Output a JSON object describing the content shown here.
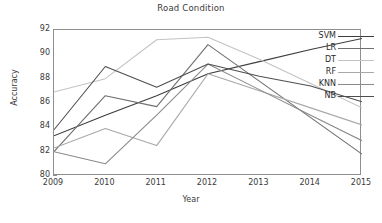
{
  "chart_data": {
    "type": "line",
    "title": "Road Condition",
    "xlabel": "Year",
    "ylabel": "Accuracy",
    "x": [
      2009,
      2010,
      2011,
      2012,
      2013,
      2014,
      2015
    ],
    "xtick_labels": [
      "2009",
      "2010",
      "2011",
      "2012",
      "2013",
      "2014",
      "2015"
    ],
    "ytick_labels": [
      "80",
      "82",
      "84",
      "86",
      "88",
      "90",
      "92"
    ],
    "yticks": [
      80,
      82,
      84,
      86,
      88,
      90,
      92
    ],
    "xlim": [
      2009,
      2015
    ],
    "ylim": [
      80,
      92
    ],
    "grid": false,
    "legend_position": "right-inside",
    "series": [
      {
        "name": "SVM",
        "color": "#3d3d3d",
        "values": [
          83.3,
          85.0,
          86.6,
          88.4,
          89.4,
          90.4,
          91.3
        ]
      },
      {
        "name": "LR",
        "color": "#6f6f6f",
        "values": [
          82.0,
          86.6,
          85.7,
          90.8,
          87.8,
          84.8,
          81.8
        ]
      },
      {
        "name": "DT",
        "color": "#c3c3c3",
        "values": [
          86.9,
          88.0,
          91.2,
          91.4,
          89.6,
          87.6,
          85.6
        ]
      },
      {
        "name": "RF",
        "color": "#a8a8a8",
        "values": [
          82.3,
          83.9,
          82.5,
          88.4,
          87.0,
          85.6,
          84.2
        ]
      },
      {
        "name": "KNN",
        "color": "#8a8a8a",
        "values": [
          82.0,
          81.0,
          85.0,
          89.2,
          87.1,
          85.0,
          82.9
        ]
      },
      {
        "name": "NB",
        "color": "#4f4f4f",
        "values": [
          83.8,
          89.0,
          87.3,
          89.2,
          88.2,
          87.4,
          86.1
        ]
      }
    ]
  }
}
